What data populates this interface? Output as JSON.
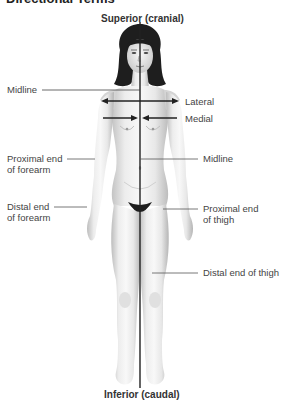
{
  "title": "Directional Terms",
  "labels": {
    "superior": "Superior (cranial)",
    "inferior": "Inferior (caudal)",
    "midline_left": "Midline",
    "lateral": "Lateral",
    "medial": "Medial",
    "midline_right": "Midline",
    "proximal_forearm_1": "Proximal end",
    "proximal_forearm_2": "of forearm",
    "distal_forearm_1": "Distal end",
    "distal_forearm_2": "of forearm",
    "proximal_thigh_1": "Proximal end",
    "proximal_thigh_2": "of thigh",
    "distal_thigh": "Distal end of thigh"
  },
  "colors": {
    "line": "#333333",
    "skin_light": "#f2f2f2",
    "skin_shadow": "#bdbdbd",
    "hair": "#1e1e1e"
  }
}
